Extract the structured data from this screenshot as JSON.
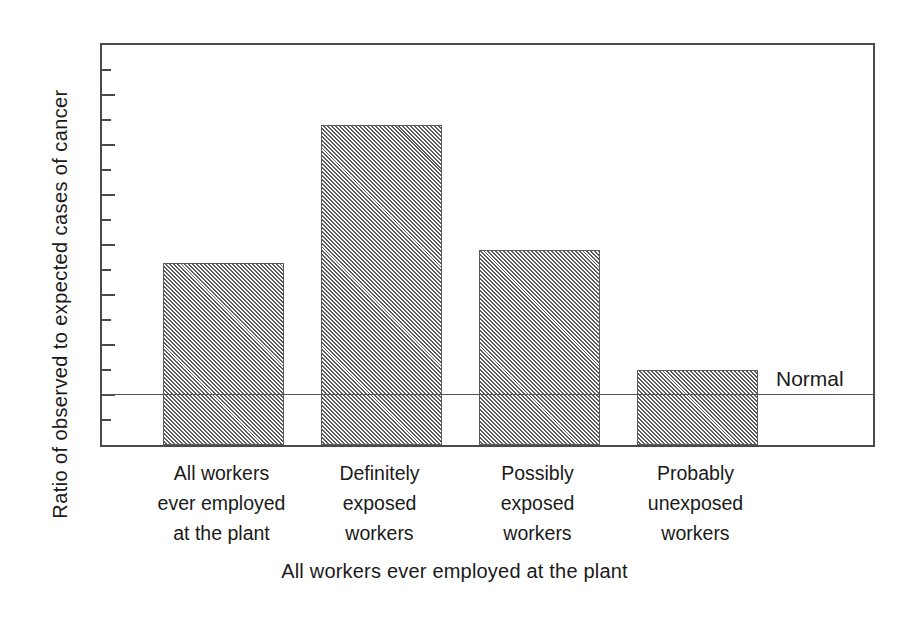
{
  "chart_data": {
    "type": "bar",
    "title": "",
    "xlabel": "All workers ever employed at the plant",
    "ylabel": "Ratio of observed to expected cases of cancer",
    "categories": [
      "All workers ever employed at the plant",
      "Definitely exposed workers",
      "Possibly exposed workers",
      "Probably unexposed workers"
    ],
    "category_lines": [
      [
        "All  workers",
        "ever  employed",
        "at  the  plant"
      ],
      [
        "Definitely",
        "exposed",
        "workers"
      ],
      [
        "Possibly",
        "exposed",
        "workers"
      ],
      [
        "Probably",
        "unexposed",
        "workers"
      ]
    ],
    "values": [
      3.65,
      6.4,
      3.9,
      1.5
    ],
    "ylim": [
      0,
      8
    ],
    "xlim": [
      0,
      4
    ],
    "ytick_labels": [
      "0",
      "1",
      "2",
      "3",
      "4",
      "5",
      "6",
      "7",
      "8"
    ],
    "ytick_values": [
      0,
      1,
      2,
      3,
      4,
      5,
      6,
      7,
      8
    ],
    "yminor_tick_values": [
      0.5,
      1.5,
      2.5,
      3.5,
      4.5,
      5.5,
      6.5,
      7.5
    ],
    "grid": false,
    "legend": null,
    "annotations": [
      {
        "name": "normal-reference-line",
        "label": "Normal",
        "y": 1.0
      }
    ],
    "colors": {
      "bar_fill": "#d8d8d8",
      "bar_edge": "#5a5a5a",
      "axis": "#4a4a4a",
      "text": "#1a1a1a",
      "reference_line": "#555555"
    }
  }
}
